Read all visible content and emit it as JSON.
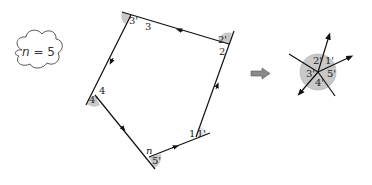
{
  "cloud": {
    "label_var": "n",
    "label_eq": " = 5"
  },
  "polygon": {
    "vertices": [
      {
        "id": "1",
        "interior_label": "1",
        "exterior_label": "1'"
      },
      {
        "id": "2",
        "interior_label": "2",
        "exterior_label": "2'"
      },
      {
        "id": "3",
        "interior_label": "3",
        "exterior_label": "3'"
      },
      {
        "id": "4",
        "interior_label": "4",
        "exterior_label": "4'"
      },
      {
        "id": "n",
        "interior_label": "n",
        "exterior_label": "5'"
      }
    ]
  },
  "transform_arrow": "right-arrow",
  "star": {
    "labels": [
      "1'",
      "2'",
      "3'",
      "4'",
      "5'"
    ]
  },
  "colors": {
    "angle_fill": "#c8c8c8",
    "line": "#111111",
    "arrow_fill": "#8a8a8a"
  }
}
